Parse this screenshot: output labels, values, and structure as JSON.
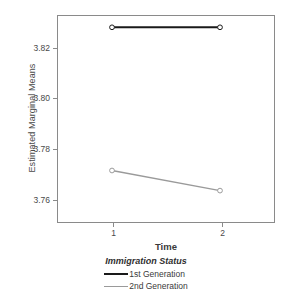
{
  "chart_data": {
    "type": "line",
    "title": "",
    "xlabel": "Time",
    "ylabel": "Estimated Marginal Means",
    "categories": [
      "1",
      "2"
    ],
    "x": [
      1,
      2
    ],
    "xlim": [
      0.5,
      2.5
    ],
    "ylim": [
      3.7505,
      3.8325
    ],
    "yticks": [
      3.82,
      3.8,
      3.78,
      3.76
    ],
    "ytick_labels": [
      "3.82",
      "3.80",
      "3.78",
      "3.76"
    ],
    "xtick_labels": [
      "1",
      "2"
    ],
    "grid": false,
    "legend_position": "bottom",
    "legend_title": "Immigration Status",
    "series": [
      {
        "name": "1st Generation",
        "values": [
          3.828,
          3.828
        ],
        "color": "#1a1a1a",
        "marker": "circle-open"
      },
      {
        "name": "2nd Generation",
        "values": [
          3.771,
          3.763
        ],
        "color": "#9a9a9a",
        "marker": "circle-open"
      }
    ]
  },
  "axes": {
    "y_title": "Estimated Marginal Means",
    "x_title": "Time"
  },
  "legend": {
    "title": "Immigration Status",
    "items": [
      {
        "label": "1st Generation",
        "color": "#1a1a1a"
      },
      {
        "label": "2nd Generation",
        "color": "#9a9a9a"
      }
    ]
  },
  "colors": {
    "axis": "#8a8a8a",
    "text": "#3a3a3a",
    "background": "#ffffff",
    "series_1": "#1a1a1a",
    "series_2": "#9a9a9a"
  }
}
